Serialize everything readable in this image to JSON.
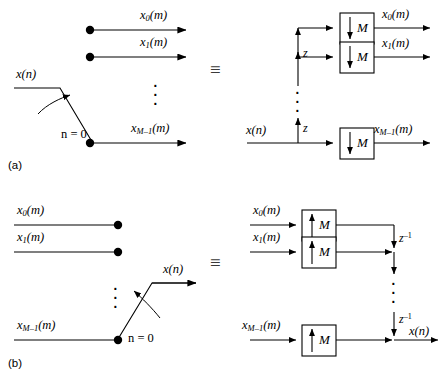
{
  "figure": {
    "equiv_symbol": "≡",
    "ellipsis_symbol": "⋮",
    "arrow_down_symbol": "↓",
    "arrow_up_symbol": "↑",
    "line_color": "#000000",
    "background_color": "#ffffff"
  },
  "panel_a": {
    "caption": "(a)",
    "left": {
      "input_label": "x(n)",
      "switch_label": "n = 0",
      "outputs": [
        {
          "label": "x",
          "sub": "0",
          "suffix": "(m)"
        },
        {
          "label": "x",
          "sub": "1",
          "suffix": "(m)"
        },
        {
          "label": "x",
          "sub": "M–1",
          "suffix": "(m)"
        }
      ]
    },
    "right": {
      "input_label": "x(n)",
      "delay_labels": [
        "z",
        "z"
      ],
      "blocks": [
        {
          "arrow": "↓",
          "factor": "M"
        },
        {
          "arrow": "↓",
          "factor": "M"
        },
        {
          "arrow": "↓",
          "factor": "M"
        }
      ],
      "outputs": [
        {
          "label": "x",
          "sub": "0",
          "suffix": "(m)"
        },
        {
          "label": "x",
          "sub": "1",
          "suffix": "(m)"
        },
        {
          "label": "x",
          "sub": "M–1",
          "suffix": "(m)"
        }
      ]
    }
  },
  "panel_b": {
    "caption": "(b)",
    "left": {
      "output_label": "x(n)",
      "switch_label": "n = 0",
      "inputs": [
        {
          "label": "x",
          "sub": "0",
          "suffix": "(m)"
        },
        {
          "label": "x",
          "sub": "1",
          "suffix": "(m)"
        },
        {
          "label": "x",
          "sub": "M–1",
          "suffix": "(m)"
        }
      ]
    },
    "right": {
      "output_label": "x(n)",
      "delay_labels": [
        "z",
        "z"
      ],
      "delay_exponents": [
        "–1",
        "–1"
      ],
      "blocks": [
        {
          "arrow": "↑",
          "factor": "M"
        },
        {
          "arrow": "↑",
          "factor": "M"
        },
        {
          "arrow": "↑",
          "factor": "M"
        }
      ],
      "inputs": [
        {
          "label": "x",
          "sub": "0",
          "suffix": "(m)"
        },
        {
          "label": "x",
          "sub": "1",
          "suffix": "(m)"
        },
        {
          "label": "x",
          "sub": "M–1",
          "suffix": "(m)"
        }
      ]
    }
  }
}
